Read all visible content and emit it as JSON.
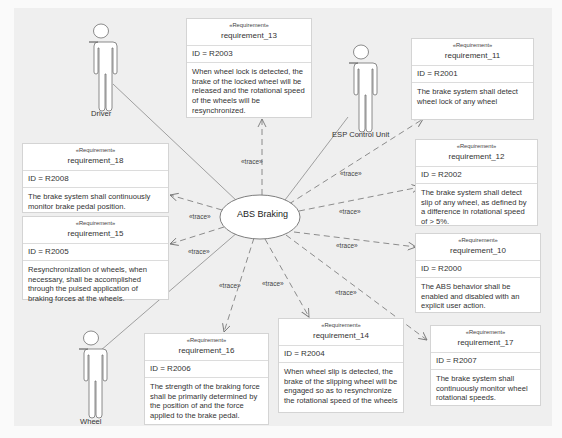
{
  "diagram": {
    "use_case": {
      "label": "ABS Braking"
    },
    "actors": [
      {
        "id": "driver",
        "label": "Driver"
      },
      {
        "id": "esp",
        "label": "ESP Control Unit"
      },
      {
        "id": "wheel",
        "label": "Wheel"
      }
    ],
    "trace_label": "«trace»",
    "stereotype": "«Requirement»",
    "requirements": {
      "r13": {
        "name": "requirement_13",
        "id": "ID = R2003",
        "text": "When wheel lock is detected, the brake of the locked wheel will be released and the rotational speed of the wheels will be resynchronized."
      },
      "r11": {
        "name": "requirement_11",
        "id": "ID = R2001",
        "text": "The brake system shall detect wheel lock of any wheel"
      },
      "r18": {
        "name": "requirement_18",
        "id": "ID = R2008",
        "text": "The brake system shall continuously monitor brake pedal position."
      },
      "r12": {
        "name": "requirement_12",
        "id": "ID = R2002",
        "text": "The brake system shall detect slip of any wheel, as defined by a difference in rotational speed of > 5%."
      },
      "r15": {
        "name": "requirement_15",
        "id": "ID = R2005",
        "text": "Resynchronization of wheels, when necessary, shall be accomplished through the pulsed application of braking forces at the wheels."
      },
      "r10": {
        "name": "requirement_10",
        "id": "ID = R2000",
        "text": "The ABS behavior shall be enabled and disabled with an explicit user action."
      },
      "r16": {
        "name": "requirement_16",
        "id": "ID = R2006",
        "text": "The strength of the braking force shall be primarily determined by the position of and the force applied to the brake pedal."
      },
      "r14": {
        "name": "requirement_14",
        "id": "ID = R2004",
        "text": "When wheel slip is detected, the brake of the slipping wheel will be engaged so as to resynchronize the rotational speed of the wheels"
      },
      "r17": {
        "name": "requirement_17",
        "id": "ID = R2007",
        "text": "The brake system shall continuously monitor wheel rotational speeds."
      }
    }
  }
}
